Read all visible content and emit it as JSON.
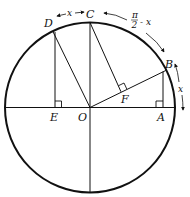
{
  "diagram": {
    "type": "unit-circle-geometry",
    "points": {
      "O": {
        "label": "O"
      },
      "A": {
        "label": "A"
      },
      "B": {
        "label": "B"
      },
      "C": {
        "label": "C"
      },
      "D": {
        "label": "D"
      },
      "E": {
        "label": "E"
      },
      "F": {
        "label": "F"
      }
    },
    "arc_labels": {
      "dc": "x",
      "cb_num": "π",
      "cb_den": "2",
      "cb_suffix": "- x",
      "ba": "x"
    },
    "colors": {
      "stroke": "#111111",
      "background": "#ffffff"
    }
  }
}
